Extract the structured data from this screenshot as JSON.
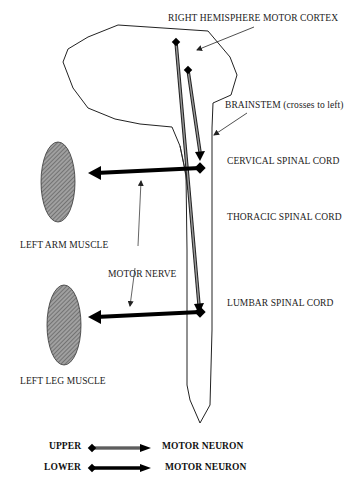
{
  "diagram": {
    "labels": {
      "motor_cortex": "RIGHT HEMISPHERE MOTOR CORTEX",
      "brainstem": "BRAINSTEM  (crosses to left)",
      "cervical": "CERVICAL SPINAL CORD",
      "thoracic": "THORACIC SPINAL CORD",
      "lumbar": "LUMBAR SPINAL CORD",
      "arm_muscle": "LEFT ARM MUSCLE",
      "leg_muscle": "LEFT LEG MUSCLE",
      "motor_nerve": "MOTOR NERVE"
    },
    "legend": {
      "upper": {
        "label": "UPPER",
        "description": "MOTOR NEURON",
        "style": "double-line arrow (gray fill)"
      },
      "lower": {
        "label": "LOWER",
        "description": "MOTOR NEURON",
        "style": "thick solid black arrow"
      }
    },
    "colors": {
      "outline": "#222222",
      "upper_neuron_fill": "#888888",
      "lower_neuron": "#000000",
      "muscle_fill": "#8c8c8c",
      "background": "#ffffff"
    }
  }
}
